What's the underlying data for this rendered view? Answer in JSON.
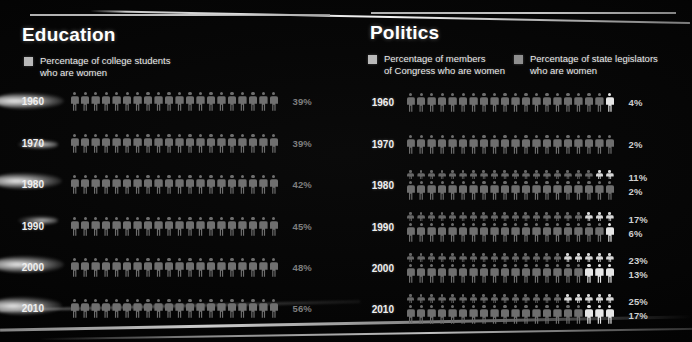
{
  "panels": {
    "education": {
      "title": "Education",
      "legend": [
        {
          "icon": "legend-swatch",
          "label": "Percentage of college students\nwho are women"
        }
      ],
      "rows": [
        {
          "year": "1960",
          "pct_label": "39%",
          "value": 39,
          "total": 20
        },
        {
          "year": "1970",
          "pct_label": "39%",
          "value": 39,
          "total": 20
        },
        {
          "year": "1980",
          "pct_label": "42%",
          "value": 42,
          "total": 20
        },
        {
          "year": "1990",
          "pct_label": "45%",
          "value": 45,
          "total": 20
        },
        {
          "year": "2000",
          "pct_label": "48%",
          "value": 48,
          "total": 20
        },
        {
          "year": "2010",
          "pct_label": "56%",
          "value": 56,
          "total": 20
        }
      ]
    },
    "politics": {
      "title": "Politics",
      "legend": [
        {
          "icon": "legend-swatch",
          "label": "Percentage of members\nof Congress who are women"
        },
        {
          "icon": "legend-swatch",
          "label": "Percentage of state legislators\nwho are women"
        }
      ],
      "rows": [
        {
          "year": "1960",
          "congress_pct_label": "4%",
          "congress_value": 4,
          "legis_pct_label": "",
          "legis_value": 0,
          "total": 20,
          "show_legis": false
        },
        {
          "year": "1970",
          "congress_pct_label": "2%",
          "congress_value": 2,
          "legis_pct_label": "",
          "legis_value": 0,
          "total": 20,
          "show_legis": false
        },
        {
          "year": "1980",
          "congress_pct_label": "2%",
          "congress_value": 2,
          "legis_pct_label": "11%",
          "legis_value": 11,
          "total": 20,
          "show_legis": true
        },
        {
          "year": "1990",
          "congress_pct_label": "6%",
          "congress_value": 6,
          "legis_pct_label": "17%",
          "legis_value": 17,
          "total": 20,
          "show_legis": true
        },
        {
          "year": "2000",
          "congress_pct_label": "13%",
          "congress_value": 13,
          "legis_pct_label": "23%",
          "legis_value": 23,
          "total": 20,
          "show_legis": true
        },
        {
          "year": "2010",
          "congress_pct_label": "17%",
          "congress_value": 17,
          "legis_pct_label": "25%",
          "legis_value": 25,
          "total": 20,
          "show_legis": true
        }
      ]
    }
  },
  "chart_data": {
    "type": "bar",
    "xlabel": "Year",
    "ylabel": "Percent women",
    "ylim": [
      0,
      100
    ],
    "categories": [
      "1960",
      "1970",
      "1980",
      "1990",
      "2000",
      "2010"
    ],
    "series": [
      {
        "name": "Percentage of college students who are women",
        "panel": "Education",
        "values": [
          39,
          39,
          42,
          45,
          48,
          56
        ]
      },
      {
        "name": "Percentage of members of Congress who are women",
        "panel": "Politics",
        "values": [
          4,
          2,
          2,
          6,
          13,
          17
        ]
      },
      {
        "name": "Percentage of state legislators who are women",
        "panel": "Politics",
        "values": [
          null,
          null,
          11,
          17,
          23,
          25
        ]
      }
    ],
    "legend_position": "top",
    "grid": false
  },
  "colors": {
    "background": "#000000",
    "figure_dim": "#6f6f6f",
    "figure_highlight": "#e6e6e6",
    "title_text": "#ffffff",
    "legend_text": "#e9e9e9",
    "percent_text": "#7e7e7e",
    "rule": "#d8d8d8"
  }
}
